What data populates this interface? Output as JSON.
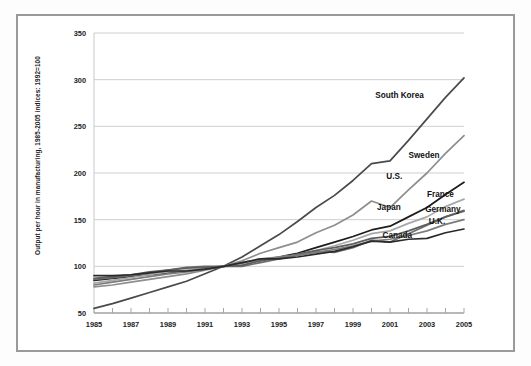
{
  "chart_data": {
    "type": "line",
    "title": "",
    "subtitle": "",
    "ylabel": "Output per hour in manufacturing, 1985-2005 indices: 1992=100",
    "xlabel": "",
    "xlim": [
      1985,
      2005
    ],
    "ylim": [
      50,
      350
    ],
    "grid": true,
    "legend_position": "inline-right-labels",
    "yticks": [
      50,
      100,
      150,
      200,
      250,
      300,
      350
    ],
    "ytick_labels": [
      "50",
      "100",
      "150",
      "200",
      "250",
      "300",
      "350"
    ],
    "x": [
      1985,
      1986,
      1987,
      1988,
      1989,
      1990,
      1991,
      1992,
      1993,
      1994,
      1995,
      1996,
      1997,
      1998,
      1999,
      2000,
      2001,
      2002,
      2003,
      2004,
      2005
    ],
    "xticks": [
      1985,
      1986,
      1987,
      1988,
      1989,
      1990,
      1991,
      1992,
      1993,
      1994,
      1995,
      1996,
      1997,
      1998,
      1999,
      2000,
      2001,
      2002,
      2003,
      2004,
      2005
    ],
    "xtick_labels": [
      "1985",
      "",
      "1987",
      "",
      "1989",
      "",
      "1991",
      "",
      "1993",
      "",
      "1995",
      "",
      "1997",
      "",
      "1999",
      "",
      "2001",
      "",
      "2003",
      "",
      "2005"
    ],
    "series": [
      {
        "name": "South Korea",
        "color": "#4a4a4a",
        "label_x": 2000.2,
        "label_y": 283,
        "values": [
          55,
          60,
          66,
          72,
          78,
          84,
          92,
          100,
          110,
          122,
          134,
          148,
          163,
          176,
          192,
          210,
          213,
          235,
          258,
          281,
          302
        ]
      },
      {
        "name": "Sweden",
        "color": "#8e8e8e",
        "label_x": 2002.0,
        "label_y": 218,
        "values": [
          78,
          80,
          83,
          86,
          89,
          92,
          96,
          100,
          106,
          114,
          120,
          126,
          136,
          144,
          155,
          170,
          163,
          182,
          200,
          221,
          240
        ]
      },
      {
        "name": "U.S.",
        "color": "#1c1c1c",
        "label_x": 2000.8,
        "label_y": 196,
        "values": [
          85,
          87,
          89,
          91,
          93,
          95,
          97,
          100,
          103,
          106,
          110,
          114,
          120,
          126,
          132,
          139,
          143,
          153,
          163,
          177,
          190
        ]
      },
      {
        "name": "France",
        "color": "#a8a8a8",
        "label_x": 2003.0,
        "label_y": 176,
        "values": [
          82,
          85,
          88,
          91,
          94,
          96,
          98,
          100,
          102,
          107,
          110,
          112,
          117,
          122,
          128,
          135,
          138,
          146,
          153,
          164,
          172
        ]
      },
      {
        "name": "Japan",
        "color": "#6e6e6e",
        "label_x": 2000.3,
        "label_y": 163,
        "values": [
          86,
          88,
          90,
          93,
          96,
          99,
          100,
          100,
          100,
          104,
          108,
          112,
          116,
          115,
          120,
          128,
          126,
          135,
          144,
          153,
          160
        ]
      },
      {
        "name": "Germany",
        "color": "#5e5e5e",
        "label_x": 2002.9,
        "label_y": 160,
        "values": [
          87,
          89,
          91,
          94,
          96,
          98,
          99,
          100,
          101,
          106,
          109,
          113,
          117,
          120,
          124,
          130,
          132,
          138,
          145,
          153,
          159
        ]
      },
      {
        "name": "U.K.",
        "color": "#7c7c7c",
        "label_x": 2003.1,
        "label_y": 147,
        "values": [
          80,
          83,
          86,
          89,
          92,
          94,
          97,
          100,
          104,
          108,
          110,
          112,
          115,
          118,
          122,
          127,
          129,
          133,
          138,
          145,
          150
        ]
      },
      {
        "name": "Canada",
        "color": "#2a2a2a",
        "label_x": 2000.6,
        "label_y": 132,
        "values": [
          90,
          90,
          91,
          93,
          95,
          95,
          97,
          100,
          104,
          108,
          108,
          110,
          113,
          116,
          121,
          127,
          126,
          129,
          130,
          136,
          140
        ]
      }
    ]
  }
}
